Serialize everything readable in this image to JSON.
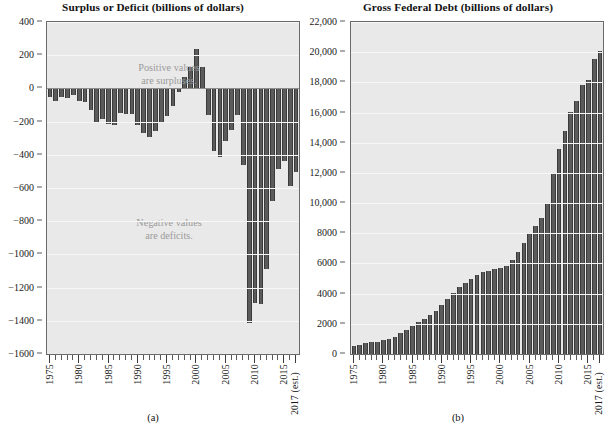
{
  "figure": {
    "panels": [
      {
        "id": "a",
        "caption": "(a)",
        "title": "Surplus or Deficit (billions of dollars)",
        "annotations": [
          {
            "name": "positive-values-note",
            "line1": "Positive values",
            "line2": "are surpluses."
          },
          {
            "name": "negative-values-note",
            "line1": "Negative values",
            "line2": "are deficits."
          }
        ]
      },
      {
        "id": "b",
        "caption": "(b)",
        "title": "Gross Federal Debt (billions of dollars)"
      }
    ],
    "colors": {
      "bar": "#5b5b5b",
      "bar_edge": "#3a3a3a",
      "plot_background": "#e9e9e9",
      "axis": "#6a6a6a",
      "annotation_text": "#9b9b9b",
      "gridline": "#f7f7f7",
      "zero_line": "#8d8d8d"
    }
  },
  "chart_data": [
    {
      "type": "bar",
      "panel": "a",
      "title": "Surplus or Deficit (billions of dollars)",
      "xlabel": "",
      "ylabel": "",
      "ylim": [
        -1600,
        400
      ],
      "ytick_step": 200,
      "ytick_labels": [
        "400",
        "200",
        "0",
        "−200",
        "−400",
        "−600",
        "−800",
        "−1000",
        "−1200",
        "−1400",
        "−1600"
      ],
      "ytick_values": [
        400,
        200,
        0,
        -200,
        -400,
        -600,
        -800,
        -1000,
        -1200,
        -1400,
        -1600
      ],
      "xtick_labels": [
        "1975",
        "1980",
        "1985",
        "1990",
        "1995",
        "2000",
        "2005",
        "2010",
        "2015",
        "2017 (est.)"
      ],
      "xtick_years": [
        1975,
        1980,
        1985,
        1990,
        1995,
        2000,
        2005,
        2010,
        2015,
        2017
      ],
      "grid": true,
      "legend": "none",
      "categories": [
        1975,
        1976,
        1977,
        1978,
        1979,
        1980,
        1981,
        1982,
        1983,
        1984,
        1985,
        1986,
        1987,
        1988,
        1989,
        1990,
        1991,
        1992,
        1993,
        1994,
        1995,
        1996,
        1997,
        1998,
        1999,
        2000,
        2001,
        2002,
        2003,
        2004,
        2005,
        2006,
        2007,
        2008,
        2009,
        2010,
        2011,
        2012,
        2013,
        2014,
        2015,
        2016,
        2017
      ],
      "values": [
        -53,
        -74,
        -54,
        -59,
        -41,
        -74,
        -79,
        -128,
        -208,
        -185,
        -212,
        -221,
        -150,
        -155,
        -153,
        -221,
        -269,
        -290,
        -255,
        -203,
        -164,
        -107,
        -22,
        69,
        126,
        236,
        128,
        -158,
        -378,
        -413,
        -318,
        -248,
        -161,
        -459,
        -1413,
        -1294,
        -1300,
        -1087,
        -680,
        -485,
        -438,
        -585,
        -503
      ]
    },
    {
      "type": "bar",
      "panel": "b",
      "title": "Gross Federal Debt (billions of dollars)",
      "xlabel": "",
      "ylabel": "",
      "ylim": [
        0,
        22000
      ],
      "ytick_step": 2000,
      "ytick_labels": [
        "22,000",
        "20,000",
        "18,000",
        "16,000",
        "14,000",
        "12,000",
        "10,000",
        "8000",
        "6000",
        "4000",
        "2000",
        "0"
      ],
      "ytick_values": [
        22000,
        20000,
        18000,
        16000,
        14000,
        12000,
        10000,
        8000,
        6000,
        4000,
        2000,
        0
      ],
      "xtick_labels": [
        "1975",
        "1980",
        "1985",
        "1990",
        "1995",
        "2000",
        "2005",
        "2010",
        "2015",
        "2017 (est.)"
      ],
      "xtick_years": [
        1975,
        1980,
        1985,
        1990,
        1995,
        2000,
        2005,
        2010,
        2015,
        2017
      ],
      "grid": true,
      "legend": "none",
      "categories": [
        1975,
        1976,
        1977,
        1978,
        1979,
        1980,
        1981,
        1982,
        1983,
        1984,
        1985,
        1986,
        1987,
        1988,
        1989,
        1990,
        1991,
        1992,
        1993,
        1994,
        1995,
        1996,
        1997,
        1998,
        1999,
        2000,
        2001,
        2002,
        2003,
        2004,
        2005,
        2006,
        2007,
        2008,
        2009,
        2010,
        2011,
        2012,
        2013,
        2014,
        2015,
        2016,
        2017
      ],
      "values": [
        533,
        620,
        699,
        772,
        827,
        908,
        998,
        1142,
        1377,
        1572,
        1823,
        2125,
        2350,
        2602,
        2857,
        3233,
        3665,
        4065,
        4411,
        4693,
        4974,
        5225,
        5413,
        5526,
        5656,
        5674,
        5807,
        6228,
        6783,
        7379,
        7933,
        8507,
        9008,
        10025,
        11910,
        13562,
        14790,
        16066,
        16738,
        17824,
        18151,
        19573,
        20101
      ]
    }
  ]
}
